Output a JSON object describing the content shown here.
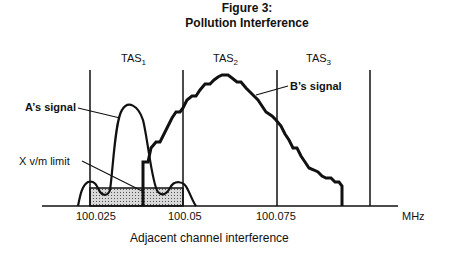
{
  "figure": {
    "title": "Figure 3:",
    "subtitle": "Pollution Interference",
    "caption": "Adjacent channel interference"
  },
  "channels": [
    {
      "label": "TAS",
      "sub": "1"
    },
    {
      "label": "TAS",
      "sub": "2"
    },
    {
      "label": "TAS",
      "sub": "3"
    }
  ],
  "annotations": {
    "a_signal": "A’s signal",
    "b_signal": "B’s signal",
    "limit": "X v/m limit"
  },
  "axis": {
    "ticks": [
      "100.025",
      "100.05",
      "100.075"
    ],
    "unit": "MHz"
  },
  "colors": {
    "line": "#111111",
    "shade": "#bdbdbd"
  }
}
